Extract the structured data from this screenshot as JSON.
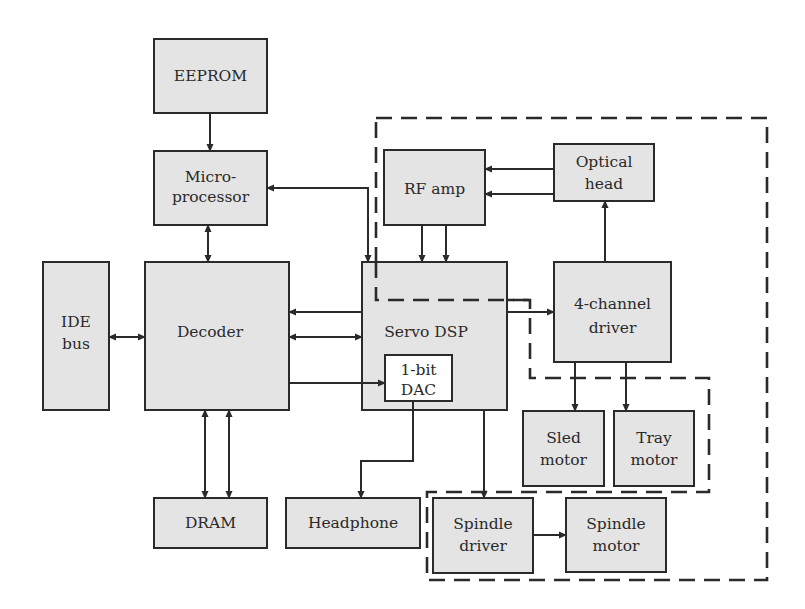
{
  "diagram": {
    "title": "",
    "colors": {
      "box_fill": "#e4e4e4",
      "stroke": "#2a2a2a",
      "background": "#ffffff"
    },
    "blocks": {
      "eeprom": {
        "lines": [
          "EEPROM"
        ]
      },
      "microprocessor": {
        "lines": [
          "Micro-",
          "processor"
        ]
      },
      "ide_bus": {
        "lines": [
          "IDE",
          "bus"
        ]
      },
      "decoder": {
        "lines": [
          "Decoder"
        ]
      },
      "rf_amp": {
        "lines": [
          "RF amp"
        ]
      },
      "optical_head": {
        "lines": [
          "Optical",
          "head"
        ]
      },
      "servo_dsp": {
        "lines": [
          "Servo DSP"
        ]
      },
      "dac": {
        "lines": [
          "1-bit",
          "DAC"
        ]
      },
      "four_channel_driver": {
        "lines": [
          "4-channel",
          "driver"
        ]
      },
      "sled_motor": {
        "lines": [
          "Sled",
          "motor"
        ]
      },
      "tray_motor": {
        "lines": [
          "Tray",
          "motor"
        ]
      },
      "dram": {
        "lines": [
          "DRAM"
        ]
      },
      "headphone": {
        "lines": [
          "Headphone"
        ]
      },
      "spindle_driver": {
        "lines": [
          "Spindle",
          "driver"
        ]
      },
      "spindle_motor": {
        "lines": [
          "Spindle",
          "motor"
        ]
      }
    },
    "connections": [
      {
        "from": "EEPROM",
        "to": "Micro-processor",
        "direction": "one-way"
      },
      {
        "from": "Micro-processor",
        "to": "Decoder",
        "direction": "bidirectional"
      },
      {
        "from": "Micro-processor",
        "to": "Servo DSP",
        "direction": "bidirectional"
      },
      {
        "from": "IDE bus",
        "to": "Decoder",
        "direction": "bidirectional"
      },
      {
        "from": "Servo DSP",
        "to": "Decoder",
        "direction": "one-way"
      },
      {
        "from": "Servo DSP",
        "to": "Decoder",
        "direction": "bidirectional"
      },
      {
        "from": "Decoder",
        "to": "1-bit DAC",
        "direction": "one-way"
      },
      {
        "from": "Decoder",
        "to": "DRAM",
        "direction": "bidirectional",
        "count": 2
      },
      {
        "from": "Optical head",
        "to": "RF amp",
        "direction": "one-way",
        "count": 2
      },
      {
        "from": "RF amp",
        "to": "Servo DSP",
        "direction": "one-way",
        "count": 2
      },
      {
        "from": "Servo DSP",
        "to": "4-channel driver",
        "direction": "one-way"
      },
      {
        "from": "4-channel driver",
        "to": "Optical head",
        "direction": "one-way"
      },
      {
        "from": "4-channel driver",
        "to": "Sled motor",
        "direction": "one-way"
      },
      {
        "from": "4-channel driver",
        "to": "Tray motor",
        "direction": "one-way"
      },
      {
        "from": "1-bit DAC",
        "to": "Headphone",
        "direction": "one-way"
      },
      {
        "from": "Servo DSP",
        "to": "Spindle driver",
        "direction": "one-way"
      },
      {
        "from": "Spindle driver",
        "to": "Spindle motor",
        "direction": "one-way"
      }
    ],
    "groupings": [
      {
        "name": "outer-dashed-region",
        "style": "dashed"
      },
      {
        "name": "inner-dashed-region",
        "style": "dashed"
      },
      {
        "name": "spindle-dashed-region",
        "style": "dashed"
      }
    ]
  }
}
